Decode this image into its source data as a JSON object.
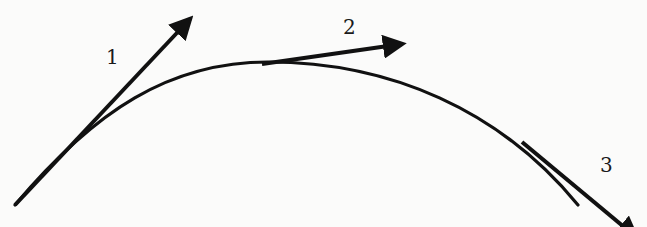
{
  "diagram": {
    "type": "curve-with-tangent-vectors",
    "stroke_color": "#111111",
    "background": "#fbfbfa",
    "curve": {
      "start": [
        15,
        205
      ],
      "peak": [
        268,
        62
      ],
      "end": [
        578,
        205
      ]
    },
    "tangents": [
      {
        "label": "1",
        "from": [
          15,
          205
        ],
        "to": [
          193,
          15
        ],
        "label_pos": [
          106,
          47
        ]
      },
      {
        "label": "2",
        "from": [
          262,
          64
        ],
        "to": [
          406,
          43
        ],
        "label_pos": [
          343,
          17
        ]
      },
      {
        "label": "3",
        "from": [
          522,
          142
        ],
        "to": [
          640,
          240
        ],
        "label_pos": [
          600,
          155
        ]
      }
    ]
  }
}
